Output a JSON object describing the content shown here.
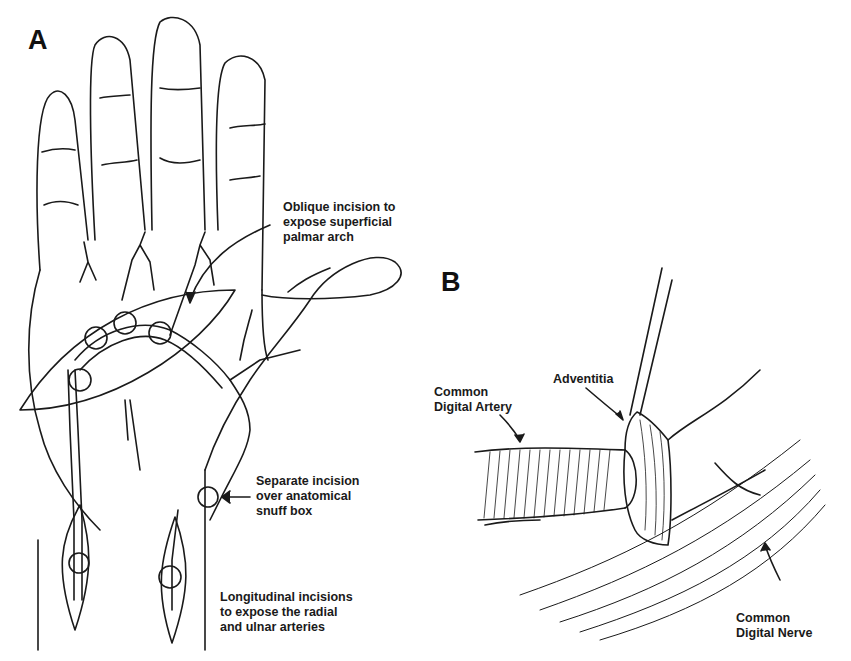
{
  "figure": {
    "panel_a": {
      "letter": "A",
      "signature": "SCHMITZ",
      "labels": {
        "oblique": "Oblique incision to\nexpose superficial\npalmar arch",
        "snuff_box": "Separate incision\nover anatomical\nsnuff box",
        "longitudinal": "Longitudinal incisions\nto expose the radial\nand ulnar arteries"
      }
    },
    "panel_b": {
      "letter": "B",
      "signature": "SCHMITZ",
      "labels": {
        "artery": "Common\nDigital Artery",
        "adventitia": "Adventitia",
        "nerve": "Common\nDigital Nerve"
      }
    },
    "colors": {
      "line": "#1a1a1a",
      "background": "#ffffff"
    }
  }
}
